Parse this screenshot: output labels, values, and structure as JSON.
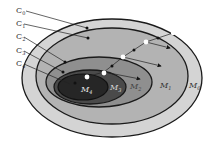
{
  "diagram": {
    "regions": [
      {
        "id": "M0",
        "label": "M",
        "sub": "0",
        "fill": "#d4d4d4"
      },
      {
        "id": "M1",
        "label": "M",
        "sub": "1",
        "fill": "#b3b3b3"
      },
      {
        "id": "M2",
        "label": "M",
        "sub": "2",
        "fill": "#8c8c8c"
      },
      {
        "id": "M3",
        "label": "M",
        "sub": "3",
        "fill": "#4a4a4a"
      },
      {
        "id": "M4",
        "label": "M",
        "sub": "4",
        "fill": "#262626"
      }
    ],
    "callouts": [
      {
        "label": "C",
        "sub": "0"
      },
      {
        "label": "C",
        "sub": "1"
      },
      {
        "label": "C",
        "sub": "2"
      },
      {
        "label": "C",
        "sub": "3"
      },
      {
        "label": "C",
        "sub": "4"
      }
    ],
    "colors": {
      "stroke": "#1a1a1a",
      "white_node": "#ffffff",
      "black_node": "#111111"
    }
  }
}
